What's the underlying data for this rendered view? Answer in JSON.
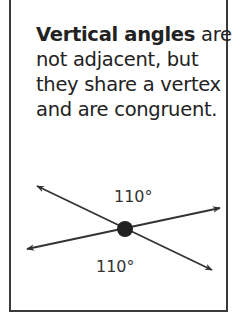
{
  "card": {
    "caption_bold": "Vertical angles",
    "caption_rest": " are not adjacent, but they share a vertex and are congruent."
  },
  "diagram": {
    "top_angle_label": "110°",
    "bottom_angle_label": "110°",
    "line_color": "#333333",
    "vertex_color": "#222222"
  }
}
